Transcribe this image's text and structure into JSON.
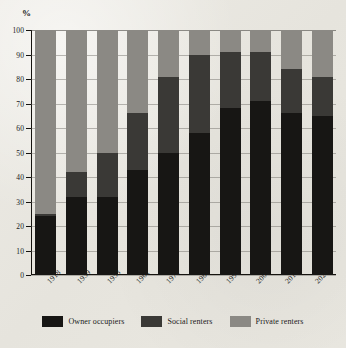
{
  "chart_data": {
    "type": "bar",
    "stacked": true,
    "title": "",
    "xlabel": "",
    "ylabel": "%",
    "ylim": [
      0,
      100
    ],
    "yticks": [
      0,
      10,
      20,
      30,
      40,
      50,
      60,
      70,
      80,
      90,
      100
    ],
    "grid": true,
    "legend_position": "bottom",
    "categories": [
      "1918",
      "1939",
      "1953",
      "1961",
      "1971",
      "1981",
      "1991",
      "2001",
      "2011",
      "2020"
    ],
    "series": [
      {
        "name": "Owner occupiers",
        "color": "#171614",
        "values": [
          24,
          32,
          32,
          43,
          50,
          58,
          68,
          71,
          66,
          65
        ]
      },
      {
        "name": "Social renters",
        "color": "#3a3936",
        "values": [
          1,
          10,
          18,
          23,
          31,
          32,
          23,
          20,
          18,
          16
        ]
      },
      {
        "name": "Private renters",
        "color": "#8b8984",
        "values": [
          75,
          58,
          50,
          34,
          19,
          10,
          9,
          9,
          16,
          19
        ]
      }
    ],
    "series_tops": [
      {
        "name": "Owner occupiers",
        "tops": [
          24,
          32,
          32,
          43,
          50,
          58,
          68,
          71,
          66,
          65
        ]
      },
      {
        "name": "Social renters",
        "tops": [
          25,
          42,
          50,
          66,
          81,
          90,
          91,
          91,
          84,
          81
        ]
      },
      {
        "name": "Private renters",
        "tops": [
          100,
          100,
          100,
          100,
          100,
          100,
          100,
          100,
          100,
          100
        ]
      }
    ]
  },
  "axis": {
    "y_unit": "%",
    "tick_labels": [
      "100",
      "90",
      "80",
      "70",
      "60",
      "50",
      "40",
      "30",
      "20",
      "10",
      "0"
    ]
  },
  "legend": {
    "items": [
      {
        "label": "Owner occupiers",
        "color": "#171614"
      },
      {
        "label": "Social renters",
        "color": "#3a3936"
      },
      {
        "label": "Private renters",
        "color": "#8b8984"
      }
    ]
  }
}
